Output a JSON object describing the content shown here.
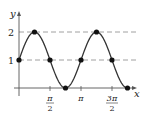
{
  "chart_data": {
    "type": "line",
    "title": "",
    "function": "y = 1 + sin(2x)",
    "xlabel": "x",
    "ylabel": "y",
    "x_ticks": [
      {
        "value": 1.5708,
        "num": "π",
        "den": "2",
        "label": "π/2"
      },
      {
        "value": 3.1416,
        "label": "π"
      },
      {
        "value": 4.7124,
        "num": "3π",
        "den": "2",
        "label": "3π/2"
      }
    ],
    "y_ticks": [
      {
        "value": 1,
        "label": "1"
      },
      {
        "value": 2,
        "label": "2"
      }
    ],
    "reference_lines": [
      {
        "y": 1,
        "style": "dashed"
      },
      {
        "y": 2,
        "style": "dashed"
      }
    ],
    "marked_points": [
      {
        "x": 0,
        "y": 1
      },
      {
        "x": 0.7854,
        "y": 2
      },
      {
        "x": 1.5708,
        "y": 1
      },
      {
        "x": 2.3562,
        "y": 0
      },
      {
        "x": 3.1416,
        "y": 1
      },
      {
        "x": 3.927,
        "y": 2
      },
      {
        "x": 4.7124,
        "y": 1
      },
      {
        "x": 5.4978,
        "y": 0
      }
    ],
    "xlim": [
      0,
      5.5
    ],
    "ylim": [
      0,
      2.4
    ],
    "grid": false,
    "legend": null,
    "colors": {
      "curve": "#333333",
      "axis": "#555555",
      "dashed": "#888888",
      "points": "#111111"
    }
  }
}
